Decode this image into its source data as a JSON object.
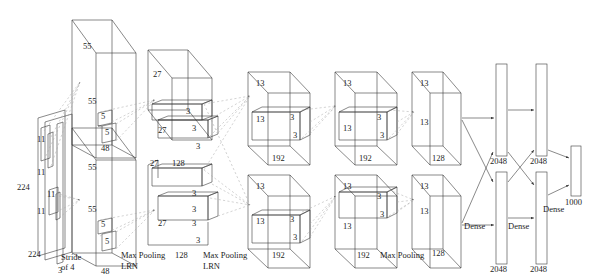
{
  "figure": {
    "title_faint": "",
    "domain": "neural-network-architecture-diagram",
    "name": "AlexNet CNN architecture"
  },
  "input": {
    "width_label": "224",
    "height_label": "224",
    "channels_label": "3",
    "kernel_a": "11",
    "kernel_b": "11",
    "kernel_c": "11",
    "kernel_d": "11",
    "stride_line1": "Stride",
    "stride_line2": "of 4"
  },
  "conv1": {
    "top_depth": "55",
    "front_size": "55",
    "kernel_w": "5",
    "kernel_h": "5",
    "channels": "48",
    "top2_depth": "55",
    "front2_size": "55",
    "kernel2_w": "5",
    "kernel2_h": "5",
    "channels2": "48",
    "pool_line1": "Max Pooling",
    "pool_line2": "LRN"
  },
  "conv2": {
    "top_depth": "27",
    "front_size": "27",
    "front_size_b": "27",
    "kernel_a": "3",
    "kernel_b": "3",
    "kernel_c": "3",
    "channels": "128",
    "front2_size": "27",
    "kernel2_a": "3",
    "kernel2_b": "3",
    "kernel2_c": "3",
    "kernel2_d": "3",
    "channels2": "128",
    "pool_line1": "Max Pooling",
    "pool_line2": "LRN"
  },
  "conv3": {
    "top_depth": "13",
    "front_size": "13",
    "kernel_a": "3",
    "kernel_b": "3",
    "channels": "192",
    "top2_depth": "13",
    "front2_size": "13",
    "kernel2_a": "3",
    "kernel2_b": "3",
    "channels2": "192"
  },
  "conv4": {
    "top_depth": "13",
    "front_size": "13",
    "kernel_a": "3",
    "kernel_b": "3",
    "channels": "192",
    "top2_depth": "13",
    "front2_size": "13",
    "kernel2_a": "3",
    "kernel2_b": "3",
    "channels2": "192"
  },
  "conv5": {
    "top_depth": "13",
    "front_size": "13",
    "channels": "128",
    "top2_depth": "13",
    "front2_size": "13",
    "channels2": "128",
    "pool_label": "Max Pooling"
  },
  "fc": {
    "fc6_top": "2048",
    "fc6_bottom": "2048",
    "fc7_top": "2048",
    "fc7_bottom": "2048",
    "dense_1": "Dense",
    "dense_2": "Dense",
    "dense_3": "Dense",
    "output": "1000"
  },
  "colors": {
    "stroke": "#3a3a3a",
    "dashed": "#9a9a9a",
    "text": "#1d1d1d",
    "background": "#ffffff"
  }
}
